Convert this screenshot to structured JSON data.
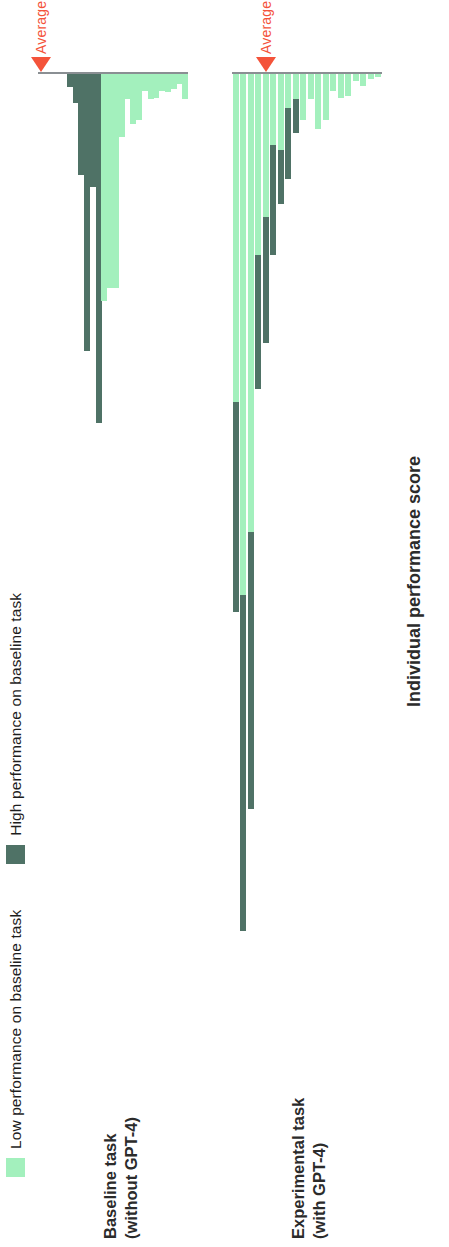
{
  "colors": {
    "high": "#4f7266",
    "low": "#a3f0bd",
    "axis": "#8a8f93",
    "average": "#f4533a",
    "text": "#2b2b2b"
  },
  "legend": {
    "items": [
      {
        "label": "Low performance on baseline task",
        "color": "#a3f0bd",
        "key": "low"
      },
      {
        "label": "High performance on baseline task",
        "color": "#4f7266",
        "key": "high"
      }
    ]
  },
  "groups": {
    "baseline": {
      "label": "Baseline task\n(without GPT-4)"
    },
    "experimental": {
      "label": "Experimental task\n(with GPT-4)"
    }
  },
  "axis": {
    "x_title": "Individual performance score",
    "average_label": "Average"
  },
  "chart_data": {
    "type": "bar",
    "title": "",
    "subtitle": "",
    "xlabel": "Individual performance score",
    "ylabel": "",
    "orientation": "horizontal-diverging",
    "grid": false,
    "legend_position": "top-left",
    "legend": [
      "Low performance on baseline task",
      "High performance on baseline task"
    ],
    "series": [
      {
        "name": "Low performance on baseline task",
        "color": "#a3f0bd"
      },
      {
        "name": "High performance on baseline task",
        "color": "#4f7266"
      }
    ],
    "note": "Each bar is one individual. Bars extend left (negative) or right (positive) from a vertical zero reference line. x values are relative performance-score offsets read off the figure.",
    "panels": [
      {
        "name": "Baseline task (without GPT-4)",
        "axis_zero": 0,
        "average": -0.02,
        "bars": [
          {
            "group": "high",
            "value": 0.0
          },
          {
            "group": "high",
            "value": 0.0
          },
          {
            "group": "high",
            "value": 0.0
          },
          {
            "group": "high",
            "value": 0.0
          },
          {
            "group": "high",
            "value": 0.0
          },
          {
            "group": "high",
            "value": -0.015
          },
          {
            "group": "high",
            "value": -0.035
          },
          {
            "group": "high",
            "value": -0.12
          },
          {
            "group": "high",
            "value": -0.33
          },
          {
            "group": "high",
            "value": -0.135
          },
          {
            "group": "high",
            "value": -0.415
          },
          {
            "group": "low",
            "value": -0.27
          },
          {
            "group": "low",
            "value": -0.255
          },
          {
            "group": "low",
            "value": -0.255
          },
          {
            "group": "low",
            "value": -0.075
          },
          {
            "group": "low",
            "value": -0.03
          },
          {
            "group": "low",
            "value": -0.06
          },
          {
            "group": "low",
            "value": -0.055
          },
          {
            "group": "low",
            "value": -0.02
          },
          {
            "group": "low",
            "value": -0.03
          },
          {
            "group": "low",
            "value": -0.028
          },
          {
            "group": "low",
            "value": -0.02
          },
          {
            "group": "low",
            "value": -0.022
          },
          {
            "group": "low",
            "value": -0.018
          },
          {
            "group": "low",
            "value": -0.012
          },
          {
            "group": "low",
            "value": -0.03
          }
        ]
      },
      {
        "name": "Experimental task (with GPT-4)",
        "axis_zero": 0,
        "average": -0.36,
        "bars": [
          {
            "group": "low",
            "low": -0.39,
            "high": -0.64
          },
          {
            "group": "low",
            "low": -0.62,
            "high": -1.02
          },
          {
            "group": "low",
            "low": -0.545,
            "high": -0.875
          },
          {
            "group": "low",
            "low": -0.215,
            "high": -0.375
          },
          {
            "group": "low",
            "low": -0.17,
            "high": -0.32
          },
          {
            "group": "low",
            "low": -0.085,
            "high": -0.215
          },
          {
            "group": "low",
            "low": -0.09,
            "high": -0.155
          },
          {
            "group": "low",
            "low": -0.04,
            "high": -0.125
          },
          {
            "group": "low",
            "low": -0.03,
            "high": -0.07
          },
          {
            "group": "low",
            "low": -0.055,
            "high": -0.055
          },
          {
            "group": "low",
            "low": -0.03,
            "high": -0.03
          },
          {
            "group": "low",
            "low": -0.065,
            "high": -0.065
          },
          {
            "group": "low",
            "low": -0.055,
            "high": -0.055
          },
          {
            "group": "low",
            "low": -0.02,
            "high": -0.02
          },
          {
            "group": "low",
            "low": -0.028,
            "high": -0.028
          },
          {
            "group": "low",
            "low": -0.026,
            "high": -0.026
          },
          {
            "group": "low",
            "low": -0.008,
            "high": -0.008
          },
          {
            "group": "low",
            "low": -0.014,
            "high": -0.014
          },
          {
            "group": "low",
            "low": -0.006,
            "high": -0.006
          },
          {
            "group": "low",
            "low": -0.004,
            "high": -0.004
          }
        ]
      }
    ]
  }
}
